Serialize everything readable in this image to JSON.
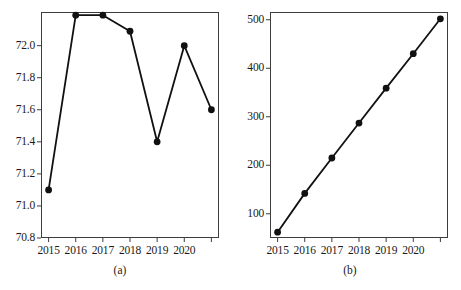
{
  "figure": {
    "panels": [
      {
        "caption": "(a)",
        "caption_x": 120,
        "caption_y": 264,
        "frame": {
          "left": 41,
          "top": 12,
          "width": 178,
          "height": 226
        },
        "axis": {
          "ylim": [
            70.8,
            72.21
          ],
          "yticks": [
            70.8,
            71.0,
            71.2,
            71.4,
            71.6,
            71.8,
            72.0
          ],
          "ytick_labels": [
            "70.8",
            "71.0",
            "71.2",
            "71.4",
            "71.6",
            "71.8",
            "72.0"
          ],
          "xticks": [
            2015,
            2016,
            2017,
            2018,
            2019,
            2020,
            2021
          ],
          "xtick_labels": [
            "2015",
            "2016",
            "2017",
            "2018",
            "2019",
            "2020",
            ""
          ],
          "xlim": [
            2014.72,
            2021.28
          ],
          "grid": false,
          "legend": "none"
        },
        "chart_data": {
          "type": "line",
          "title": "",
          "xlabel": "",
          "ylabel": "",
          "categories": [
            "2015",
            "2016",
            "2017",
            "2018",
            "2019",
            "2020",
            "2021"
          ],
          "x": [
            2015,
            2016,
            2017,
            2018,
            2019,
            2020,
            2021
          ],
          "values": [
            71.1,
            72.19,
            72.19,
            72.09,
            71.4,
            72.0,
            71.6
          ],
          "ylim": [
            70.8,
            72.21
          ],
          "marker": "filled-circle",
          "marker_color": "#111111",
          "line_color": "#111111",
          "grid": false,
          "legend": "none"
        }
      },
      {
        "caption": "(b)",
        "caption_x": 350,
        "caption_y": 264,
        "frame": {
          "left": 270,
          "top": 12,
          "width": 178,
          "height": 226
        },
        "axis": {
          "ylim": [
            50,
            516
          ],
          "yticks": [
            100,
            200,
            300,
            400,
            500
          ],
          "ytick_labels": [
            "100",
            "200",
            "300",
            "400",
            "500"
          ],
          "xticks": [
            2015,
            2016,
            2017,
            2018,
            2019,
            2020,
            2021
          ],
          "xtick_labels": [
            "2015",
            "2016",
            "2017",
            "2018",
            "2019",
            "2020",
            ""
          ],
          "xlim": [
            2014.72,
            2021.28
          ],
          "grid": false,
          "legend": "none"
        },
        "chart_data": {
          "type": "line",
          "title": "",
          "xlabel": "",
          "ylabel": "",
          "categories": [
            "2015",
            "2016",
            "2017",
            "2018",
            "2019",
            "2020",
            "2021"
          ],
          "x": [
            2015,
            2016,
            2017,
            2018,
            2019,
            2020,
            2021
          ],
          "values": [
            62,
            142,
            215,
            287,
            359,
            430,
            502
          ],
          "ylim": [
            50,
            516
          ],
          "marker": "filled-circle",
          "marker_color": "#111111",
          "line_color": "#111111",
          "grid": false,
          "legend": "none"
        }
      }
    ],
    "style": {
      "line_color": "#111111",
      "marker_color": "#111111",
      "frame_color": "#3c3c3c",
      "background": "#ffffff"
    }
  }
}
